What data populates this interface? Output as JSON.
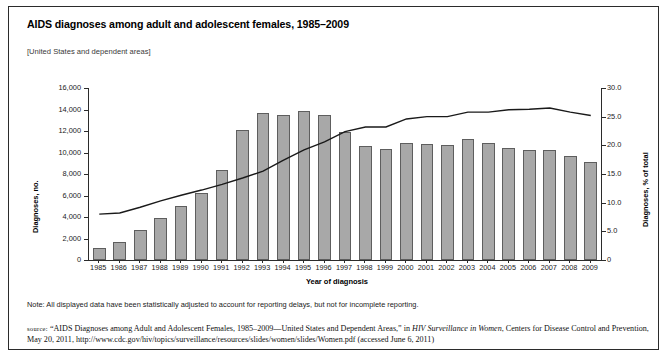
{
  "title": "AIDS diagnoses among adult and adolescent females, 1985–2009",
  "subtitle": "[United States and dependent areas]",
  "note": "Note: All displayed data have been statistically adjusted to account for reporting delays, but not for incomplete reporting.",
  "source": {
    "label": "source:",
    "line1_pre": "“AIDS Diagnoses among Adult and Adolescent Females, 1985–2009—United States and Dependent Areas,” in ",
    "line1_italic": "HIV Surveillance in Women",
    "line1_post": ",",
    "line2": "Centers for Disease Control and Prevention, May 20, 2011, http://www.cdc.gov/hiv/topics/surveillance/resources/slides/women/slides/Women.pdf",
    "line3": "(accessed June 6, 2011)"
  },
  "chart_data": {
    "type": "bar",
    "title": "AIDS diagnoses among adult and adolescent females, 1985–2009",
    "xlabel": "Year of diagnosis",
    "ylabel": "Diagnoses, no.",
    "ylabel_right": "Diagnoses, % of total",
    "ylim": [
      0,
      16000
    ],
    "ylim_right": [
      0,
      30
    ],
    "yticks": [
      "0",
      "2,000",
      "4,000",
      "6,000",
      "8,000",
      "10,000",
      "12,000",
      "14,000",
      "16,000"
    ],
    "yticks_right": [
      "0",
      "5.0",
      "10.0",
      "15.0",
      "20.0",
      "25.0",
      "30.0"
    ],
    "grid": false,
    "legend": "none",
    "categories": [
      "1985",
      "1986",
      "1987",
      "1988",
      "1989",
      "1990",
      "1991",
      "1992",
      "1993",
      "1994",
      "1995",
      "1996",
      "1997",
      "1998",
      "1999",
      "2000",
      "2001",
      "2002",
      "2003",
      "2004",
      "2005",
      "2006",
      "2007",
      "2008",
      "2009"
    ],
    "series": [
      {
        "name": "Diagnoses, no.",
        "type": "bar",
        "axis": "left",
        "color": "#a8a8a8",
        "values": [
          1100,
          1700,
          2800,
          3900,
          5000,
          6200,
          8400,
          12100,
          13700,
          13500,
          13900,
          13500,
          11900,
          10600,
          10300,
          10900,
          10800,
          10700,
          11300,
          10900,
          10400,
          10200,
          10200,
          9700,
          9100
        ]
      },
      {
        "name": "Diagnoses, % of total",
        "type": "line",
        "axis": "right",
        "color": "#1a1a1a",
        "values": [
          8.0,
          8.2,
          9.2,
          10.3,
          11.3,
          12.2,
          13.2,
          14.3,
          15.5,
          17.4,
          19.2,
          20.6,
          22.4,
          23.2,
          23.2,
          24.6,
          25.0,
          25.0,
          25.8,
          25.8,
          26.2,
          26.3,
          26.5,
          25.8,
          25.2
        ]
      }
    ]
  }
}
